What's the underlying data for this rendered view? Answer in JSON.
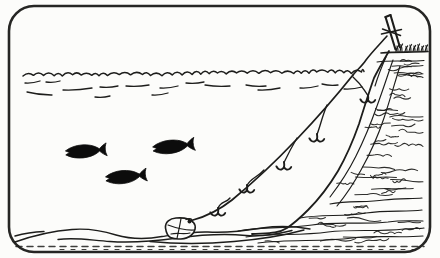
{
  "scene": {
    "subject": "hand-drawn illustration of a shore-set longline: a line tied to a stake on a cliff top runs down into the sea, carries baited hooks on droppers, and is anchored to a stone on the seabed while three fish swim nearby",
    "colors": {
      "ink": "#1d1d1b",
      "paper": "#fcfcfa",
      "fish": "#0c0c0c"
    },
    "frame": {
      "x": 9,
      "y": 6,
      "width": 421,
      "height": 246,
      "radius": 25,
      "stroke_width": 2.6
    },
    "water": {
      "surface": {
        "x_start": 23,
        "x_end": 364,
        "y": 75
      },
      "ripples": [
        [
          25,
          83,
          40,
          81
        ],
        [
          46,
          82,
          60,
          81
        ],
        [
          27,
          92,
          52,
          95
        ],
        [
          63,
          90,
          92,
          88
        ],
        [
          100,
          87,
          118,
          86
        ],
        [
          126,
          86,
          149,
          85
        ],
        [
          160,
          88,
          178,
          86
        ],
        [
          152,
          95,
          168,
          93
        ],
        [
          186,
          83,
          204,
          82
        ],
        [
          205,
          85,
          230,
          86
        ],
        [
          246,
          85,
          266,
          86
        ],
        [
          258,
          90,
          280,
          88
        ],
        [
          300,
          88,
          318,
          86
        ],
        [
          322,
          84,
          338,
          85
        ],
        [
          344,
          89,
          362,
          87
        ],
        [
          95,
          97,
          110,
          96
        ]
      ]
    },
    "fish_school": {
      "count": 3,
      "fish": [
        {
          "x": 64,
          "y": 146,
          "rotate": -5,
          "scale": 1.0
        },
        {
          "x": 151,
          "y": 142,
          "rotate": -7,
          "scale": 1.02
        },
        {
          "x": 104,
          "y": 172,
          "rotate": -6,
          "scale": 1.0
        }
      ],
      "body_path": "M1,5 C6,1.8 12,0.4 18,0.5 C24,0.6 29,2 32.5,4.2 L35,5.8 C37,3.8 39.6,1.8 42.2,0.6 C41.2,3 40.7,5 40.9,7 C40.7,9 41.2,11 42.2,13.4 C39.6,12.2 37,10.2 35,8.2 L32.5,9.8 C29,12 24,13.4 18,13.5 C12,13.6 6,12.2 1,9 L5,7 Z"
    },
    "longline": {
      "hook_count": 5,
      "above_water": "M387,36 C380,44 372,52 366,60 C362,66 357,70 353,75",
      "under_water": "M353,75 C337,95 318,117 297,139 C277,160 254,182 232,200 C218,211 204,217 193,220",
      "snoods": [
        {
          "attach": [
            353,
            77
          ],
          "hook": [
            368,
            100
          ],
          "sway": 9
        },
        {
          "attach": [
            327,
            105
          ],
          "hook": [
            317,
            139
          ],
          "sway": -5
        },
        {
          "attach": [
            297,
            138
          ],
          "hook": [
            284,
            167
          ],
          "sway": -6
        },
        {
          "attach": [
            264,
            170
          ],
          "hook": [
            247,
            190
          ],
          "sway": -6
        },
        {
          "attach": [
            230,
            198
          ],
          "hook": [
            218,
            213
          ],
          "sway": -4
        }
      ],
      "hook_glyph": "M0,-5 C0.4,-2.5 0.2,-1 0,0 M0,0 C-1,2.5 -4,3.6 -6.2,1.4 M-6.2,1.4 L-7.6,-0.6 M0,0 C1,2.5 4,3.6 6.2,1.4 M6.2,1.4 L7.2,0"
    },
    "stake": {
      "sticks": [
        "M385.5,17 L395.5,49.5",
        "M390.5,15 L400,47.5",
        "M385.5,17 L390.5,15"
      ],
      "lashing": [
        "M381.5,34 L401.5,29.5",
        "M382.5,29 L400.5,35.5"
      ]
    },
    "grass": {
      "base_y": 51.5,
      "tufts": [
        {
          "x": 396,
          "h": 6
        },
        {
          "x": 400,
          "h": 7.5
        },
        {
          "x": 405,
          "h": 5.5
        },
        {
          "x": 409,
          "h": 7
        },
        {
          "x": 413,
          "h": 6
        },
        {
          "x": 417,
          "h": 7.5
        },
        {
          "x": 421,
          "h": 5.5
        },
        {
          "x": 425,
          "h": 6.5
        }
      ]
    },
    "cliff": {
      "edge": "M389,51 C384,60 379,68 374,78 C369,92 364,108 359,124 C353,141 346,157 338,171 C329,186 319,199 308,210 C300,218 293,224 287,228 C278,234 266,233 252,234",
      "top_lines": [
        "M381,53 C396,51.5 412,52.5 428,51.5",
        "M377,62 C392,60 408,62 424,60.5"
      ],
      "inner_contours": [
        "M393,60 C388,74 383,90 377,106 C371,123 364,140 356,156 C349,170 340,184 330,197",
        "M400,66 C395,82 390,100 384,118 C378,136 370,154 361,170 C354,183 346,195 337,206",
        "M386,57 C382,66 378,76 375,86"
      ],
      "strata": [
        "M238,231 C262,226 288,229 312,225 C338,221 362,225 388,222 C402,220 414,221 423,221",
        "M246,237 C272,233 300,236 328,232 C352,229 378,232 404,229 C412,228 419,229 424,228",
        "M258,243 C290,239 322,242 352,238 C376,235 400,238 423,236",
        "M300,218 C322,214 344,217 366,213 C386,210 406,212 422,210",
        "M330,204 C348,200 366,203 384,200 C398,198 412,199 422,198"
      ],
      "edge_profile": [
        [
          51,
          389
        ],
        [
          65,
          381
        ],
        [
          78,
          374
        ],
        [
          95,
          369
        ],
        [
          110,
          365
        ],
        [
          125,
          360
        ],
        [
          140,
          355
        ],
        [
          155,
          347
        ],
        [
          170,
          339
        ],
        [
          185,
          330
        ],
        [
          200,
          317
        ],
        [
          212,
          306
        ],
        [
          225,
          294
        ],
        [
          233,
          284
        ],
        [
          240,
          262
        ],
        [
          246,
          212
        ]
      ],
      "texture": {
        "seed": 13,
        "upper_count": 40,
        "base_count": 12,
        "right_bound": 423
      }
    },
    "seabed": {
      "contours": [
        "M15,242 C32,236 52,231 72,229.5 C90,228 103,231 116,235 C130,239 146,239.5 162,236.5 C178,234 192,231.5 208,232 C226,233 244,231 262,228 C280,225.5 296,226.5 310,229",
        "M58,239.5 C76,237 92,240.5 110,241.5 C132,243 156,241 178,238 C200,235 224,233.5 246,235.5 C262,237 278,234 292,230.5",
        "M150,241.5 C176,244 206,244 234,241.5 C258,239.5 282,236 304,230",
        "M15,236 C24,233.5 34,232 44,231.5"
      ],
      "hatch": [
        {
          "y": 246.5,
          "x1": 16,
          "x2": 424,
          "dash": "6 5",
          "w": 1.5
        },
        {
          "y": 249.5,
          "x1": 60,
          "x2": 420,
          "dash": "4 7",
          "w": 1.1
        }
      ]
    },
    "stone": {
      "outline": "M165.5,228 C165,222 170,218.5 176,218 C182,217.5 190,218.5 193.5,222.5 C196.5,226 195.5,232 191,235.5 C186,239.5 176,240 170.5,237.5 C166.5,235.5 166,231.5 165.5,228 Z",
      "lashings": [
        "M181,218.5 C180,225 178.5,231 177,238.5",
        "M168,225 C176,228 185,230.5 194,230",
        "M171,234 C177,232.5 184,234.5 190,233",
        "M186,219.5 C190,217.5 193,219 192.5,222"
      ],
      "knot": {
        "cx": 189.5,
        "cy": 221.5,
        "r": 2
      }
    }
  }
}
